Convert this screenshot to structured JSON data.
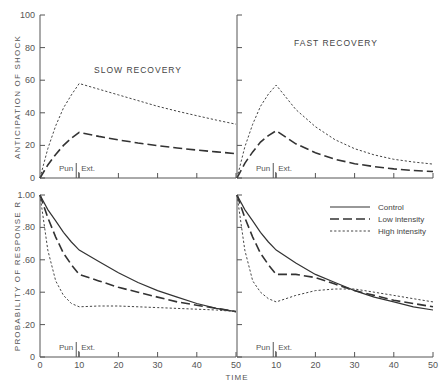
{
  "figure": {
    "x_axis_title": "TIME",
    "legend": [
      {
        "key": "control",
        "label": "Control",
        "style": "solid"
      },
      {
        "key": "low",
        "label": "Low intensity",
        "style": "long-dash"
      },
      {
        "key": "high",
        "label": "High intensity",
        "style": "dotted"
      }
    ],
    "phase_labels": {
      "pun": "Pun",
      "ext": "Ext."
    }
  },
  "chart_data": [
    {
      "type": "line",
      "panel": "top-left",
      "title": "SLOW RECOVERY",
      "xlabel": "TIME",
      "ylabel": "ANTICIPATION OF SHOCK",
      "ylim": [
        0,
        100
      ],
      "xlim": [
        0,
        50
      ],
      "yticks": [
        "0",
        "20",
        "40",
        "60",
        "80",
        "100"
      ],
      "grid": false,
      "annotations": [
        "Pun",
        "Ext."
      ],
      "x": [
        0,
        2,
        4,
        6,
        8,
        10,
        15,
        20,
        25,
        30,
        35,
        40,
        45,
        50
      ],
      "series": [
        {
          "name": "Low intensity",
          "values": [
            0,
            8,
            14.5,
            20,
            24.5,
            28,
            25.5,
            23.4,
            21.5,
            19.9,
            18.4,
            17.1,
            16,
            15
          ]
        },
        {
          "name": "High intensity",
          "values": [
            0,
            18,
            32,
            43,
            51,
            58,
            54.5,
            51,
            47.5,
            44,
            41,
            38.2,
            35.5,
            33
          ]
        }
      ]
    },
    {
      "type": "line",
      "panel": "top-right",
      "title": "FAST RECOVERY",
      "xlabel": "TIME",
      "ylabel": "ANTICIPATION OF SHOCK",
      "ylim": [
        0,
        100
      ],
      "xlim": [
        0,
        50
      ],
      "grid": false,
      "annotations": [
        "Pun",
        "Ext."
      ],
      "x": [
        0,
        2,
        4,
        6,
        8,
        10,
        15,
        20,
        25,
        30,
        35,
        40,
        45,
        50
      ],
      "series": [
        {
          "name": "Low intensity",
          "values": [
            0,
            9,
            16,
            22,
            26,
            29,
            21,
            15.5,
            11.5,
            8.8,
            7,
            5.6,
            4.6,
            4
          ]
        },
        {
          "name": "High intensity",
          "values": [
            0,
            19,
            33,
            44,
            51.5,
            57,
            42,
            31.5,
            23.5,
            18,
            14.2,
            11.5,
            9.8,
            8.5
          ]
        }
      ]
    },
    {
      "type": "line",
      "panel": "bottom-left",
      "xlabel": "TIME",
      "ylabel": "PROBABILITY OF RESPONSE R",
      "ylim": [
        0,
        1.0
      ],
      "xlim": [
        0,
        50
      ],
      "yticks": [
        "0",
        ".20",
        ".40",
        ".60",
        ".80",
        "1.00"
      ],
      "xticks": [
        "0",
        "10",
        "20",
        "30",
        "40",
        "50"
      ],
      "grid": false,
      "annotations": [
        "Pun",
        "Ext."
      ],
      "x": [
        0,
        2,
        4,
        6,
        8,
        10,
        15,
        20,
        25,
        30,
        35,
        40,
        45,
        50
      ],
      "series": [
        {
          "name": "Control",
          "values": [
            1.0,
            0.91,
            0.84,
            0.77,
            0.71,
            0.66,
            0.59,
            0.52,
            0.46,
            0.41,
            0.37,
            0.33,
            0.3,
            0.28
          ]
        },
        {
          "name": "Low intensity",
          "values": [
            1.0,
            0.86,
            0.74,
            0.64,
            0.57,
            0.51,
            0.47,
            0.43,
            0.4,
            0.37,
            0.34,
            0.32,
            0.3,
            0.28
          ]
        },
        {
          "name": "High intensity",
          "values": [
            1.0,
            0.66,
            0.47,
            0.38,
            0.33,
            0.31,
            0.315,
            0.315,
            0.31,
            0.305,
            0.3,
            0.295,
            0.29,
            0.28
          ]
        }
      ]
    },
    {
      "type": "line",
      "panel": "bottom-right",
      "xlabel": "TIME",
      "ylabel": "PROBABILITY OF RESPONSE R",
      "ylim": [
        0,
        1.0
      ],
      "xlim": [
        0,
        50
      ],
      "xticks": [
        "10",
        "20",
        "30",
        "40",
        "50"
      ],
      "grid": false,
      "annotations": [
        "Pun",
        "Ext."
      ],
      "legend_position": "upper right",
      "x": [
        0,
        2,
        4,
        6,
        8,
        10,
        15,
        20,
        25,
        30,
        35,
        40,
        45,
        50
      ],
      "series": [
        {
          "name": "Control",
          "values": [
            1.0,
            0.91,
            0.84,
            0.77,
            0.71,
            0.66,
            0.58,
            0.51,
            0.46,
            0.41,
            0.37,
            0.34,
            0.31,
            0.29
          ]
        },
        {
          "name": "Low intensity",
          "values": [
            1.0,
            0.86,
            0.74,
            0.64,
            0.57,
            0.51,
            0.51,
            0.49,
            0.45,
            0.41,
            0.38,
            0.35,
            0.33,
            0.31
          ]
        },
        {
          "name": "High intensity",
          "values": [
            1.0,
            0.66,
            0.47,
            0.4,
            0.36,
            0.34,
            0.38,
            0.41,
            0.42,
            0.42,
            0.4,
            0.38,
            0.36,
            0.34
          ]
        }
      ]
    }
  ]
}
